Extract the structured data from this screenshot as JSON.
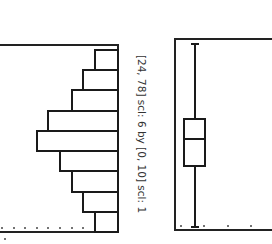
{
  "chart_data": [
    {
      "type": "bar",
      "title": "",
      "orientation": "rotated 90 degrees (bars extend leftward from right edge)",
      "window_caption": "[24, 78] scl: 6 by [0, 10] scl: 1",
      "xlabel": "",
      "ylabel": "",
      "xlim": [
        24,
        78
      ],
      "xscl": 6,
      "ylim": [
        0,
        10
      ],
      "yscl": 1,
      "categories": [
        "24-30",
        "30-36",
        "36-42",
        "42-48",
        "48-54",
        "54-60",
        "60-66",
        "66-72",
        "72-78"
      ],
      "values": [
        2,
        3,
        4,
        5,
        7,
        6,
        4,
        3,
        2
      ],
      "grid": false
    },
    {
      "type": "box",
      "orientation": "rotated 90 degrees",
      "window_caption": "[24, 78] scl: 6",
      "xlim": [
        24,
        78
      ],
      "min": 25,
      "q1": 42,
      "median": 50,
      "q3": 56,
      "max": 77
    }
  ],
  "caption": "[24, 78] scl: 6 by [0, 10] scl: 1"
}
